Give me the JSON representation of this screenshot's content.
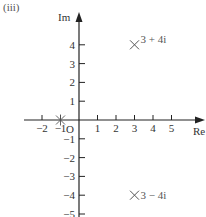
{
  "part_label": "(iii)",
  "chart_data": {
    "type": "scatter",
    "xlabel": "Re",
    "ylabel": "Im",
    "origin_label": "O",
    "x_ticks": [
      -2,
      -1,
      1,
      2,
      3,
      4,
      5
    ],
    "y_ticks": [
      4,
      3,
      2,
      1,
      -1,
      -2,
      -3,
      -4,
      -5
    ],
    "xlim": [
      -2.5,
      6
    ],
    "ylim": [
      -5.2,
      5.5
    ],
    "points": [
      {
        "label": "3 + 4i",
        "x": 3,
        "y": 4,
        "marker": "cross"
      },
      {
        "label": "3 − 4i",
        "x": 3,
        "y": -4,
        "marker": "cross"
      },
      {
        "label": "",
        "x": -1,
        "y": 0,
        "marker": "asterisk"
      }
    ],
    "grid": false
  }
}
